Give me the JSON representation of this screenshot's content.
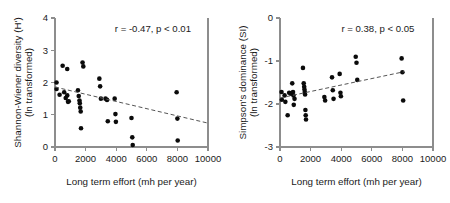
{
  "figure": {
    "panel_count": 2
  },
  "chart_data": [
    {
      "id": "shannon-wiener",
      "type": "scatter",
      "title": "",
      "xlabel": "Long term effort (mh per year)",
      "ylabel": "Shannon-Wiener diversity (H')",
      "ylabel_line2": "(ln transformed)",
      "xlim": [
        0,
        10000
      ],
      "ylim": [
        0,
        4
      ],
      "xticks": [
        0,
        2000,
        4000,
        6000,
        8000,
        10000
      ],
      "xticklabels": [
        "0",
        "2000",
        "4000",
        "6000",
        "8000",
        "10000"
      ],
      "yticks": [
        0,
        1,
        2,
        3,
        4
      ],
      "yticklabels": [
        "0",
        "1",
        "2",
        "3",
        "4"
      ],
      "grid": false,
      "legend": "none",
      "annotation": "r = -0.47, p < 0.01",
      "correlation_r": -0.47,
      "p_value_text": "p < 0.01",
      "trendline": {
        "style": "dashed",
        "x_start": 0,
        "y_start": 1.86,
        "x_end": 10000,
        "y_end": 0.74
      },
      "points": [
        [
          100,
          2.0
        ],
        [
          100,
          1.8
        ],
        [
          300,
          1.62
        ],
        [
          500,
          2.52
        ],
        [
          600,
          1.7
        ],
        [
          700,
          1.52
        ],
        [
          800,
          2.42
        ],
        [
          800,
          1.6
        ],
        [
          850,
          1.4
        ],
        [
          900,
          1.42
        ],
        [
          1500,
          1.76
        ],
        [
          1550,
          1.58
        ],
        [
          1600,
          1.44
        ],
        [
          1620,
          1.36
        ],
        [
          1650,
          1.22
        ],
        [
          1680,
          1.1
        ],
        [
          1700,
          0.58
        ],
        [
          1800,
          2.62
        ],
        [
          1850,
          2.5
        ],
        [
          2900,
          2.12
        ],
        [
          2950,
          1.88
        ],
        [
          3000,
          1.5
        ],
        [
          3300,
          1.5
        ],
        [
          3400,
          1.46
        ],
        [
          3450,
          0.8
        ],
        [
          3900,
          1.5
        ],
        [
          3950,
          1.02
        ],
        [
          3980,
          0.78
        ],
        [
          5000,
          0.9
        ],
        [
          5050,
          0.3
        ],
        [
          5080,
          0.06
        ],
        [
          7950,
          1.7
        ],
        [
          8000,
          0.88
        ],
        [
          8020,
          0.2
        ]
      ]
    },
    {
      "id": "simpsons-dominance",
      "type": "scatter",
      "title": "",
      "xlabel": "Long term effort (mh per year)",
      "ylabel": "Simpson's dominance (SI)",
      "ylabel_line2": "(ln transformed)",
      "xlim": [
        0,
        10000
      ],
      "ylim": [
        -3,
        0
      ],
      "xticks": [
        0,
        2000,
        4000,
        6000,
        8000,
        10000
      ],
      "xticklabels": [
        "0",
        "2000",
        "4000",
        "6000",
        "8000",
        "10000"
      ],
      "yticks": [
        -3,
        -2,
        -1,
        0
      ],
      "yticklabels": [
        "-3",
        "-2",
        "-1",
        "0"
      ],
      "grid": false,
      "legend": "none",
      "annotation": "r = 0.38, p < 0.05",
      "correlation_r": 0.38,
      "p_value_text": "p < 0.05",
      "trendline": {
        "style": "dashed",
        "x_start": 0,
        "y_start": -1.86,
        "x_end": 8100,
        "y_end": -1.25
      },
      "points": [
        [
          100,
          -1.72
        ],
        [
          120,
          -1.9
        ],
        [
          300,
          -1.8
        ],
        [
          350,
          -1.95
        ],
        [
          500,
          -2.26
        ],
        [
          600,
          -1.74
        ],
        [
          700,
          -1.76
        ],
        [
          800,
          -1.52
        ],
        [
          850,
          -1.72
        ],
        [
          880,
          -1.8
        ],
        [
          900,
          -2.02
        ],
        [
          950,
          -1.88
        ],
        [
          1500,
          -1.16
        ],
        [
          1550,
          -1.52
        ],
        [
          1580,
          -1.6
        ],
        [
          1600,
          -1.66
        ],
        [
          1620,
          -1.72
        ],
        [
          1640,
          -1.78
        ],
        [
          1660,
          -2.14
        ],
        [
          1680,
          -2.26
        ],
        [
          1700,
          -2.36
        ],
        [
          2900,
          -1.84
        ],
        [
          2950,
          -1.92
        ],
        [
          3400,
          -1.38
        ],
        [
          3450,
          -1.68
        ],
        [
          3500,
          -1.88
        ],
        [
          3900,
          -1.3
        ],
        [
          3950,
          -1.74
        ],
        [
          3980,
          -1.82
        ],
        [
          4950,
          -0.9
        ],
        [
          5000,
          -1.04
        ],
        [
          5050,
          -1.44
        ],
        [
          7950,
          -0.94
        ],
        [
          8000,
          -1.26
        ],
        [
          8050,
          -1.92
        ]
      ]
    }
  ]
}
